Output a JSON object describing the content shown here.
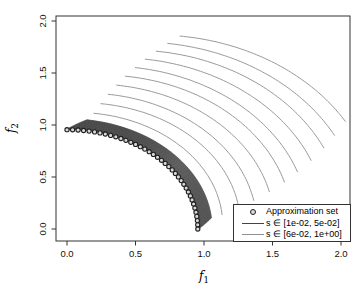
{
  "page": {
    "background": "#ffffff"
  },
  "chart_data": {
    "type": "line",
    "title": "",
    "xlabel": {
      "base": "f",
      "sub": "1"
    },
    "ylabel": {
      "base": "f",
      "sub": "2"
    },
    "axes": {
      "xlim": [
        -0.08,
        2.08
      ],
      "ylim": [
        -0.12,
        2.12
      ],
      "xticks": {
        "values": [
          0,
          0.5,
          1,
          1.5,
          2
        ],
        "labels": [
          "0.0",
          "0.5",
          "1.0",
          "1.5",
          "2.0"
        ]
      },
      "yticks": {
        "values": [
          0,
          0.5,
          1,
          1.5,
          2
        ],
        "labels": [
          "0.0",
          "0.5",
          "1.0",
          "1.5",
          "2.0"
        ]
      },
      "grid": false,
      "box": true,
      "color": "#333333"
    },
    "legend": {
      "position": "bottom-right",
      "entries": [
        {
          "type": "point",
          "label": "Approximation set",
          "color": "#222222"
        },
        {
          "type": "line",
          "label": "s ∈  [1e-02, 5e-02]",
          "color": "#444444"
        },
        {
          "type": "line",
          "label": "s ∈  [6e-02, 1e+00]",
          "color": "#8f8f8f"
        }
      ]
    },
    "approximation_set": {
      "description": "points on a quarter circle front from (0,0.955) to (0.955,0)",
      "shape": "points-on-circular-arc",
      "radius": 0.955,
      "theta_start_deg": 90,
      "theta_end_deg": 0,
      "count": 38,
      "marker": "open-circle",
      "marker_color": "#1f1f1f",
      "marker_fill": "#d8d8d8"
    },
    "series": [
      {
        "name": "s ∈ [1e-02, 5e-02]",
        "style": "dense-level-curve-band",
        "color": "#3f3f3f",
        "hatch_color": "#5a5a5a",
        "r_inner": 0.958,
        "r_outer": 1.06,
        "curve_count": 45,
        "theta_inner_span_deg": [
          0,
          90
        ],
        "end_taper_deg": [
          6,
          8
        ],
        "hatch_count": 78
      },
      {
        "name": "s ∈ [6e-02, 1e+00]",
        "style": "sparse-level-curves",
        "color": "#9a9a9a",
        "arcs": [
          {
            "thL": 80.0,
            "rL": 1.13,
            "rM": 1.15,
            "thR": 7.0,
            "rR": 1.14
          },
          {
            "thL": 78.4,
            "rL": 1.23,
            "rM": 1.27,
            "thR": 9.2,
            "rR": 1.27
          },
          {
            "thL": 76.9,
            "rL": 1.33,
            "rM": 1.38,
            "thR": 11.4,
            "rR": 1.39
          },
          {
            "thL": 75.3,
            "rL": 1.43,
            "rM": 1.5,
            "thR": 13.7,
            "rR": 1.52
          },
          {
            "thL": 73.8,
            "rL": 1.53,
            "rM": 1.62,
            "thR": 15.9,
            "rR": 1.65
          },
          {
            "thL": 72.2,
            "rL": 1.63,
            "rM": 1.73,
            "thR": 18.1,
            "rR": 1.77
          },
          {
            "thL": 70.7,
            "rL": 1.73,
            "rM": 1.85,
            "thR": 20.3,
            "rR": 1.9
          },
          {
            "thL": 69.1,
            "rL": 1.83,
            "rM": 1.97,
            "thR": 22.6,
            "rR": 2.03
          },
          {
            "thL": 67.6,
            "rL": 1.93,
            "rM": 2.08,
            "thR": 24.8,
            "rR": 2.15
          },
          {
            "thL": 66.0,
            "rL": 2.03,
            "rM": 2.2,
            "thR": 27.0,
            "rR": 2.28
          }
        ]
      }
    ]
  }
}
